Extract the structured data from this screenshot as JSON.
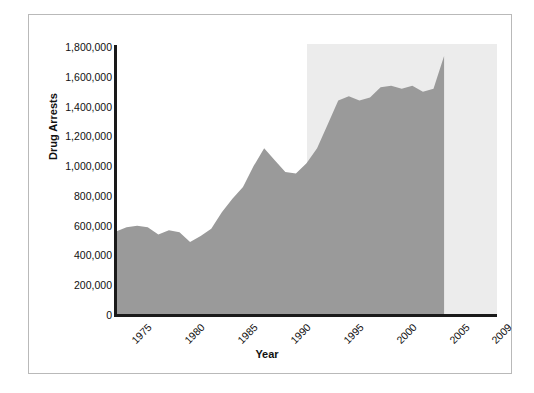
{
  "chart_data": {
    "type": "area",
    "title": "",
    "xlabel": "Year",
    "ylabel": "Drug Arrests",
    "xlim": [
      1975,
      2011
    ],
    "ylim": [
      0,
      1800000
    ],
    "grid": false,
    "legend": "none",
    "series_color": "#9a9a9a",
    "highlight_band_color": "#ececec",
    "axis_color": "#1a1a1a",
    "frame_color": "#b9b9b9",
    "highlight_band": {
      "x_start": 1993,
      "x_end": 2012,
      "label": ""
    },
    "y_ticks": [
      0,
      200000,
      400000,
      600000,
      800000,
      1000000,
      1200000,
      1400000,
      1600000,
      1800000
    ],
    "y_tick_labels": [
      "0",
      "200,000",
      "400,000",
      "600,000",
      "800,000",
      "1,000,000",
      "1,200,000",
      "1,400,000",
      "1,600,000",
      "1,800,000"
    ],
    "x_ticks": [
      1975,
      1980,
      1985,
      1990,
      1995,
      2000,
      2005,
      2009
    ],
    "x_tick_labels": [
      "1975",
      "1980",
      "1985",
      "1990",
      "1995",
      "2000",
      "2005",
      "2009"
    ],
    "x": [
      1975,
      1976,
      1977,
      1978,
      1979,
      1980,
      1981,
      1982,
      1983,
      1984,
      1985,
      1986,
      1987,
      1988,
      1989,
      1990,
      1991,
      1992,
      1993,
      1994,
      1995,
      1996,
      1997,
      1998,
      1999,
      2000,
      2001,
      2002,
      2003,
      2004,
      2005,
      2006
    ],
    "values": [
      560000,
      590000,
      600000,
      590000,
      540000,
      570000,
      555000,
      490000,
      530000,
      580000,
      690000,
      780000,
      860000,
      1000000,
      1120000,
      1040000,
      960000,
      950000,
      1020000,
      1120000,
      1280000,
      1440000,
      1470000,
      1440000,
      1460000,
      1530000,
      1540000,
      1520000,
      1540000,
      1500000,
      1520000,
      1740000
    ]
  }
}
